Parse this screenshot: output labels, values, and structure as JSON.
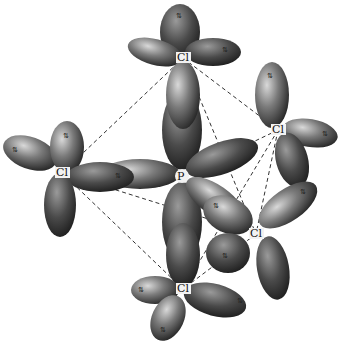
{
  "diagram": {
    "type": "molecular-orbital-geometry",
    "molecule": "PCl5",
    "central_atom": {
      "label": "P",
      "x": 182,
      "y": 176
    },
    "ligands": [
      {
        "id": "cl-top",
        "label": "Cl",
        "x": 183,
        "y": 58
      },
      {
        "id": "cl-upper-right",
        "label": "Cl",
        "x": 278,
        "y": 130
      },
      {
        "id": "cl-left",
        "label": "Cl",
        "x": 62,
        "y": 173
      },
      {
        "id": "cl-lower-right",
        "label": "Cl",
        "x": 256,
        "y": 234
      },
      {
        "id": "cl-bottom",
        "label": "Cl",
        "x": 183,
        "y": 289
      }
    ],
    "lone_pair_symbol": "⇅",
    "bond_style": "dashed",
    "colors": {
      "lobe_dark": "#2a2a2a",
      "lobe_light": "#bdbdbd",
      "bond": "#333333",
      "background": "#ffffff"
    }
  }
}
